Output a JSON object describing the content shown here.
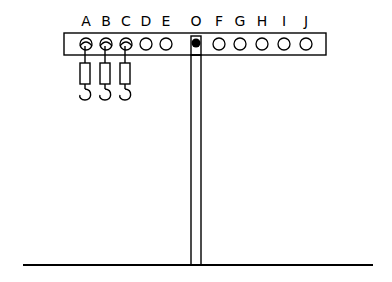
{
  "diagram": {
    "hole_labels": [
      "A",
      "B",
      "C",
      "D",
      "E",
      "O",
      "F",
      "G",
      "H",
      "I",
      "J"
    ],
    "pivot_label": "O",
    "springs_attached_at": [
      "A",
      "B",
      "C"
    ],
    "colors": {
      "line": "#000000",
      "background": "#ffffff",
      "pivot": "#000000"
    }
  }
}
